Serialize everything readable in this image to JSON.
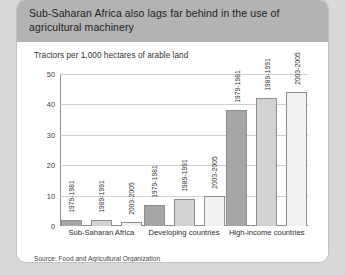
{
  "card": {
    "title": "Sub-Saharan Africa also lags far behind in the use of agricultural machinery",
    "subtitle": "Tractors per 1,000 hectares of arable land",
    "source": "Source: Food and Agricultural Organization"
  },
  "colors": {
    "page_background": "#d9d9d9",
    "header_band": "#b3b3b3",
    "card_background": "#ffffff",
    "series_1": "#a6a6a6",
    "series_2": "#d2d2d2",
    "series_3": "#f2f2f2",
    "axis": "#8e8e8e",
    "gridline": "#cfcfcf"
  },
  "chart_data": {
    "type": "bar",
    "title": "Sub-Saharan Africa also lags far behind in the use of agricultural machinery",
    "subtitle": "Tractors per 1,000 hectares of arable land",
    "xlabel": "",
    "ylabel": "Tractors per 1,000 hectares of arable land",
    "ylim": [
      0,
      50
    ],
    "yticks": [
      0,
      10,
      20,
      30,
      40,
      50
    ],
    "grid": true,
    "legend": "none",
    "bar_labels_inside": true,
    "categories": [
      "Sub-Saharan Africa",
      "Developing countries",
      "High-income countries"
    ],
    "series": [
      {
        "name": "1979-1981",
        "values": [
          2,
          7,
          38
        ]
      },
      {
        "name": "1989-1991",
        "values": [
          2,
          9,
          42
        ]
      },
      {
        "name": "2003-2005",
        "values": [
          1.3,
          10,
          44
        ]
      }
    ],
    "source": "Source: Food and Agricultural Organization"
  }
}
